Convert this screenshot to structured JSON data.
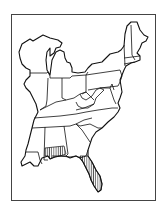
{
  "map": {
    "title": "",
    "region": "Eastern United States",
    "style": "black outline, white fill",
    "colors": {
      "outline": "#111111",
      "background": "#ffffff",
      "frame": "#444444",
      "hatch": "#111111"
    },
    "hatched_regions": [
      {
        "name": "southern Alabama / Florida panhandle",
        "pattern": "vertical-lines"
      },
      {
        "name": "eastern Florida peninsula",
        "pattern": "vertical-lines"
      }
    ]
  }
}
